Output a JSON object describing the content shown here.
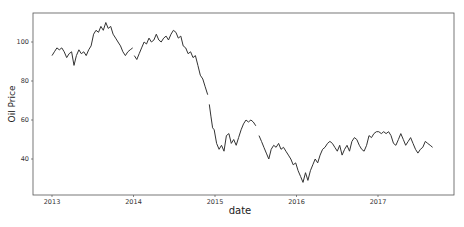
{
  "chart_data": {
    "type": "line",
    "title": "",
    "xlabel": "date",
    "ylabel": "Oil Price",
    "x_ticks": [
      "2013",
      "2014",
      "2015",
      "2016",
      "2017"
    ],
    "y_ticks": [
      40,
      60,
      80,
      100
    ],
    "xlim": [
      2012.87,
      2018.03
    ],
    "ylim": [
      22,
      115
    ],
    "grid": false,
    "legend": null,
    "line_color": "#333333",
    "series": [
      {
        "name": "Oil Price",
        "segments": [
          {
            "x": [
              2013.0,
              2013.03,
              2013.06,
              2013.09,
              2013.12,
              2013.15,
              2013.18,
              2013.21,
              2013.24,
              2013.27,
              2013.3,
              2013.33,
              2013.36,
              2013.39,
              2013.42,
              2013.45,
              2013.48,
              2013.51,
              2013.54,
              2013.57,
              2013.6,
              2013.63,
              2013.66,
              2013.69,
              2013.72,
              2013.75,
              2013.78,
              2013.81,
              2013.84,
              2013.87,
              2013.9,
              2013.93,
              2013.96,
              2013.99
            ],
            "y": [
              93,
              95,
              97,
              96,
              97,
              95,
              92,
              94,
              95,
              88,
              93,
              96,
              94,
              95,
              93,
              96,
              98,
              104,
              106,
              105,
              108,
              106,
              110,
              107,
              108,
              104,
              102,
              100,
              98,
              95,
              93,
              95,
              96,
              97
            ]
          },
          {
            "x": [
              2014.01,
              2014.04,
              2014.07,
              2014.1,
              2014.13,
              2014.16,
              2014.19,
              2014.22,
              2014.25,
              2014.28,
              2014.31,
              2014.34,
              2014.37,
              2014.4,
              2014.43,
              2014.46,
              2014.49,
              2014.52,
              2014.55,
              2014.58,
              2014.61,
              2014.64,
              2014.67,
              2014.7,
              2014.73,
              2014.76,
              2014.79,
              2014.82,
              2014.85,
              2014.88,
              2014.91
            ],
            "y": [
              93,
              91,
              94,
              97,
              100,
              99,
              102,
              100,
              101,
              104,
              101,
              100,
              102,
              103,
              101,
              104,
              106,
              105,
              102,
              103,
              98,
              97,
              94,
              95,
              92,
              93,
              88,
              83,
              81,
              77,
              73
            ]
          },
          {
            "x": [
              2014.93,
              2014.95,
              2014.97,
              2014.99,
              2015.02,
              2015.05,
              2015.08,
              2015.11,
              2015.14,
              2015.17,
              2015.2,
              2015.23,
              2015.26,
              2015.29,
              2015.32,
              2015.35,
              2015.38,
              2015.41,
              2015.44,
              2015.47,
              2015.5
            ],
            "y": [
              68,
              62,
              56,
              55,
              48,
              45,
              47,
              44,
              52,
              53,
              48,
              50,
              47,
              51,
              55,
              58,
              60,
              59,
              60,
              59,
              57
            ]
          },
          {
            "x": [
              2015.54,
              2015.57,
              2015.6,
              2015.63,
              2015.66,
              2015.69,
              2015.72,
              2015.75,
              2015.78,
              2015.81,
              2015.84,
              2015.87,
              2015.9,
              2015.93,
              2015.96,
              2015.99,
              2016.02,
              2016.05,
              2016.08,
              2016.11,
              2016.14,
              2016.17,
              2016.2,
              2016.23,
              2016.26,
              2016.29,
              2016.32,
              2016.35,
              2016.38,
              2016.41,
              2016.44,
              2016.47,
              2016.5,
              2016.53,
              2016.56,
              2016.59,
              2016.62,
              2016.65,
              2016.68,
              2016.71,
              2016.74,
              2016.77,
              2016.8,
              2016.83,
              2016.86,
              2016.89,
              2016.92,
              2016.95,
              2016.98,
              2017.01,
              2017.04,
              2017.07,
              2017.1,
              2017.13,
              2017.16,
              2017.19,
              2017.22,
              2017.25,
              2017.28,
              2017.31,
              2017.34,
              2017.37,
              2017.4,
              2017.43,
              2017.46,
              2017.49,
              2017.52,
              2017.55,
              2017.58,
              2017.61,
              2017.64,
              2017.67
            ],
            "y": [
              52,
              49,
              46,
              43,
              40,
              45,
              47,
              46,
              48,
              45,
              46,
              44,
              42,
              40,
              37,
              38,
              34,
              31,
              28,
              33,
              29,
              34,
              37,
              40,
              38,
              42,
              45,
              46,
              48,
              49,
              48,
              46,
              44,
              47,
              42,
              45,
              47,
              44,
              49,
              51,
              50,
              47,
              45,
              44,
              47,
              52,
              51,
              53,
              54,
              54,
              53,
              54,
              53,
              54,
              52,
              48,
              47,
              50,
              53,
              50,
              47,
              49,
              51,
              48,
              45,
              43,
              45,
              46,
              49,
              48,
              47,
              46
            ]
          }
        ]
      }
    ],
    "caption": ""
  },
  "axes": {
    "xlabel": "date",
    "ylabel": "Oil Price",
    "x_ticks": [
      {
        "label": "2013",
        "value": 2013
      },
      {
        "label": "2014",
        "value": 2014
      },
      {
        "label": "2015",
        "value": 2015
      },
      {
        "label": "2016",
        "value": 2016
      },
      {
        "label": "2017",
        "value": 2017
      }
    ],
    "y_ticks": [
      {
        "label": "40",
        "value": 40
      },
      {
        "label": "60",
        "value": 60
      },
      {
        "label": "80",
        "value": 80
      },
      {
        "label": "100",
        "value": 100
      }
    ]
  }
}
